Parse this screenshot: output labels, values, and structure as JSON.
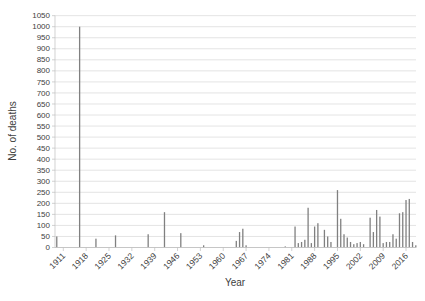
{
  "chart_data": {
    "type": "bar",
    "title": "",
    "xlabel": "Year",
    "ylabel": "No. of deaths",
    "ylim": [
      0,
      1050
    ],
    "ytick_step": 50,
    "xticks": [
      "1911",
      "1918",
      "1925",
      "1932",
      "1939",
      "1946",
      "1953",
      "1960",
      "1967",
      "1974",
      "1981",
      "1988",
      "1995",
      "2002",
      "2009",
      "2016"
    ],
    "x_range": [
      1908,
      2020
    ],
    "grid": "horizontal-on",
    "legend": "none",
    "bar_color": "#808080",
    "gridline_color": "#d9d9d9",
    "axis_line_color": "#bfbfbf",
    "text_color": "#404040",
    "points": [
      {
        "year": 1909,
        "deaths": 50
      },
      {
        "year": 1916,
        "deaths": 1000
      },
      {
        "year": 1921,
        "deaths": 40
      },
      {
        "year": 1927,
        "deaths": 55
      },
      {
        "year": 1937,
        "deaths": 60
      },
      {
        "year": 1942,
        "deaths": 160
      },
      {
        "year": 1947,
        "deaths": 65
      },
      {
        "year": 1954,
        "deaths": 10
      },
      {
        "year": 1964,
        "deaths": 30
      },
      {
        "year": 1965,
        "deaths": 70
      },
      {
        "year": 1966,
        "deaths": 85
      },
      {
        "year": 1967,
        "deaths": 10
      },
      {
        "year": 1979,
        "deaths": 5
      },
      {
        "year": 1982,
        "deaths": 95
      },
      {
        "year": 1983,
        "deaths": 20
      },
      {
        "year": 1984,
        "deaths": 25
      },
      {
        "year": 1985,
        "deaths": 35
      },
      {
        "year": 1986,
        "deaths": 180
      },
      {
        "year": 1987,
        "deaths": 20
      },
      {
        "year": 1988,
        "deaths": 95
      },
      {
        "year": 1989,
        "deaths": 110
      },
      {
        "year": 1991,
        "deaths": 80
      },
      {
        "year": 1992,
        "deaths": 50
      },
      {
        "year": 1993,
        "deaths": 25
      },
      {
        "year": 1995,
        "deaths": 260
      },
      {
        "year": 1996,
        "deaths": 130
      },
      {
        "year": 1997,
        "deaths": 60
      },
      {
        "year": 1998,
        "deaths": 45
      },
      {
        "year": 1999,
        "deaths": 25
      },
      {
        "year": 2000,
        "deaths": 15
      },
      {
        "year": 2001,
        "deaths": 20
      },
      {
        "year": 2002,
        "deaths": 25
      },
      {
        "year": 2003,
        "deaths": 15
      },
      {
        "year": 2005,
        "deaths": 135
      },
      {
        "year": 2006,
        "deaths": 70
      },
      {
        "year": 2007,
        "deaths": 170
      },
      {
        "year": 2008,
        "deaths": 140
      },
      {
        "year": 2009,
        "deaths": 20
      },
      {
        "year": 2010,
        "deaths": 25
      },
      {
        "year": 2011,
        "deaths": 25
      },
      {
        "year": 2012,
        "deaths": 60
      },
      {
        "year": 2013,
        "deaths": 40
      },
      {
        "year": 2014,
        "deaths": 155
      },
      {
        "year": 2015,
        "deaths": 160
      },
      {
        "year": 2016,
        "deaths": 215
      },
      {
        "year": 2017,
        "deaths": 220
      },
      {
        "year": 2018,
        "deaths": 25
      },
      {
        "year": 2019,
        "deaths": 10
      }
    ]
  }
}
